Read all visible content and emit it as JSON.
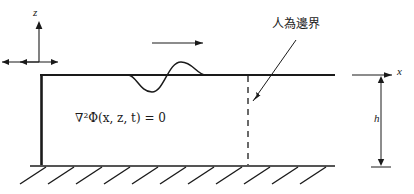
{
  "figure": {
    "labels": {
      "z_axis": "z",
      "x_axis": "x",
      "depth": "h",
      "governing_equation": "∇²Φ(x, z, t) = 0",
      "artificial_boundary": "人為邊界"
    },
    "colors": {
      "stroke": "#1a1a1a",
      "background": "#ffffff"
    },
    "geometry": {
      "free_surface_y": 75,
      "seabed_y": 166,
      "left_wall_x": 41,
      "surface_right_x": 335,
      "dashed_boundary_x": 248,
      "wave_start_x": 128,
      "wave_end_x": 205,
      "propagation_arrow": {
        "x1": 152,
        "x2": 206,
        "y": 43
      },
      "wavemaker_arrow": {
        "x1": 17,
        "x2": 61,
        "y": 62
      },
      "depth_dimension_x": 381,
      "hatch_count": 11
    }
  }
}
